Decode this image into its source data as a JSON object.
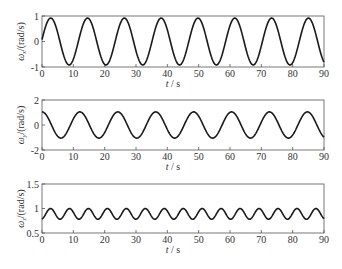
{
  "chart_data": [
    {
      "type": "line",
      "title": "",
      "xlabel": "t / s",
      "ylabel": "ω_x / (rad / s)",
      "ylabel_symbol": "ω",
      "ylabel_sub": "x",
      "ylabel_unit": "/(rad/s)",
      "xlim": [
        0,
        90
      ],
      "ylim": [
        -1,
        1
      ],
      "xticks": [
        0,
        10,
        20,
        30,
        40,
        50,
        60,
        70,
        80,
        90
      ],
      "yticks": [
        -1,
        0,
        1
      ],
      "grid": false,
      "legend": null,
      "series": [
        {
          "name": "ω_x",
          "model": "0.92*sin(2π(t+0.15)/11.75)",
          "x": [
            0,
            3,
            6,
            9,
            12,
            15,
            18,
            21,
            24,
            27,
            30,
            33,
            36,
            39,
            42,
            45,
            48,
            51,
            54,
            57,
            60,
            63,
            66,
            69,
            72,
            75,
            78,
            81,
            84,
            87,
            90
          ],
          "values": [
            0.07,
            0.92,
            0.02,
            -0.92,
            -0.03,
            0.9,
            0.07,
            -0.91,
            -0.11,
            0.87,
            0.16,
            -0.88,
            -0.2,
            0.84,
            0.25,
            -0.84,
            -0.29,
            0.8,
            0.33,
            -0.79,
            -0.37,
            0.75,
            0.41,
            -0.74,
            -0.44,
            0.7,
            0.48,
            -0.68,
            -0.52,
            0.64,
            0.55
          ]
        }
      ]
    },
    {
      "type": "line",
      "title": "",
      "xlabel": "t / s",
      "ylabel": "ω_y / (rad / s)",
      "ylabel_symbol": "ω",
      "ylabel_sub": "y",
      "ylabel_unit": "/(rad/s)",
      "xlim": [
        0,
        90
      ],
      "ylim": [
        -2,
        2
      ],
      "xticks": [
        0,
        10,
        20,
        30,
        40,
        50,
        60,
        70,
        80,
        90
      ],
      "yticks": [
        -2,
        0,
        2
      ],
      "grid": false,
      "legend": null,
      "series": [
        {
          "name": "ω_y",
          "model": "1.05*cos(2π t/12.1)",
          "x": [
            0,
            3,
            6,
            9,
            12,
            15,
            18,
            21,
            24,
            27,
            30,
            33,
            36,
            39,
            42,
            45,
            48,
            51,
            54,
            57,
            60,
            63,
            66,
            69,
            72,
            75,
            78,
            81,
            84,
            87,
            90
          ],
          "values": [
            1.05,
            0.03,
            -1.05,
            -0.08,
            1.05,
            0.12,
            -1.04,
            -0.17,
            1.04,
            0.22,
            -1.02,
            -0.26,
            1.02,
            0.31,
            -1.0,
            -0.35,
            0.99,
            0.4,
            -0.97,
            -0.44,
            0.96,
            0.49,
            -0.94,
            -0.53,
            0.91,
            0.57,
            -0.89,
            -0.61,
            0.86,
            0.65,
            -0.83
          ]
        }
      ]
    },
    {
      "type": "line",
      "title": "",
      "xlabel": "t / s",
      "ylabel": "ω_z / (rad / s)",
      "ylabel_symbol": "ω",
      "ylabel_sub": "z",
      "ylabel_unit": "/(rad/s)",
      "xlim": [
        0,
        90
      ],
      "ylim": [
        0.5,
        1.5
      ],
      "xticks": [
        0,
        10,
        20,
        30,
        40,
        50,
        60,
        70,
        80,
        90
      ],
      "yticks": [
        0.5,
        1,
        1.5
      ],
      "grid": false,
      "legend": null,
      "series": [
        {
          "name": "ω_z",
          "model": "0.89 - 0.11*cos(2π(t+0.3)/6.05)",
          "x": [
            0,
            1.5,
            3,
            4.5,
            6,
            7.5,
            9,
            10.5,
            12,
            13.5,
            15,
            16.5,
            18,
            19.5,
            21,
            22.5,
            24,
            25.5,
            27,
            28.5,
            30,
            31.5,
            33,
            34.5,
            36,
            37.5,
            39,
            40.5,
            42,
            43.5,
            45,
            46.5,
            48,
            49.5,
            51,
            52.5,
            54,
            55.5,
            57,
            58.5,
            60,
            61.5,
            63,
            64.5,
            66,
            67.5,
            69,
            70.5,
            72,
            73.5,
            75,
            76.5,
            78,
            79.5,
            81,
            82.5,
            84,
            85.5,
            87,
            88.5,
            90
          ],
          "values": [
            0.79,
            0.91,
            1.0,
            0.88,
            0.78,
            0.89,
            1.0,
            0.9,
            0.78,
            0.87,
            0.99,
            0.92,
            0.79,
            0.85,
            0.98,
            0.94,
            0.8,
            0.83,
            0.97,
            0.96,
            0.81,
            0.82,
            0.96,
            0.97,
            0.83,
            0.8,
            0.94,
            0.99,
            0.84,
            0.79,
            0.92,
            1.0,
            0.86,
            0.78,
            0.9,
            1.0,
            0.88,
            0.78,
            0.88,
            1.0,
            0.9,
            0.78,
            0.86,
            1.0,
            0.92,
            0.79,
            0.84,
            0.99,
            0.94,
            0.8,
            0.83,
            0.98,
            0.96,
            0.81,
            0.81,
            0.97,
            0.97,
            0.82,
            0.8,
            0.95,
            0.88
          ]
        }
      ]
    }
  ],
  "figure": {
    "line_color": "#1a1a1a",
    "axis_color": "#555555",
    "text_color": "#333333",
    "background": "#ffffff"
  }
}
